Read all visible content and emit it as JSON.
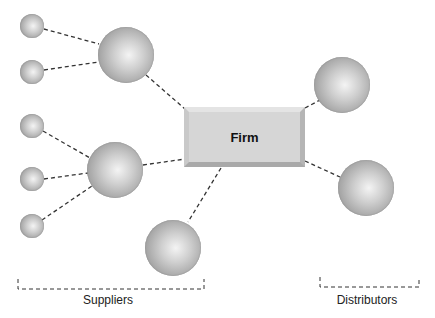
{
  "diagram": {
    "center": {
      "label": "Firm"
    },
    "groups": [
      {
        "label": "Suppliers",
        "label_x": 108,
        "label_y": 293
      },
      {
        "label": "Distributors",
        "label_x": 367,
        "label_y": 293
      }
    ],
    "nodes": {
      "small_suppliers": [
        {
          "cx": 32,
          "cy": 26,
          "r": 12
        },
        {
          "cx": 32,
          "cy": 72,
          "r": 12
        },
        {
          "cx": 32,
          "cy": 126,
          "r": 12
        },
        {
          "cx": 32,
          "cy": 179,
          "r": 12
        },
        {
          "cx": 32,
          "cy": 226,
          "r": 12
        }
      ],
      "large_suppliers": [
        {
          "cx": 126,
          "cy": 55,
          "r": 28
        },
        {
          "cx": 115,
          "cy": 170,
          "r": 28
        },
        {
          "cx": 173,
          "cy": 248,
          "r": 28
        }
      ],
      "distributors": [
        {
          "cx": 342,
          "cy": 85,
          "r": 28
        },
        {
          "cx": 366,
          "cy": 188,
          "r": 28
        }
      ]
    },
    "edges": [
      {
        "x1": 44,
        "y1": 29,
        "x2": 99,
        "y2": 44
      },
      {
        "x1": 44,
        "y1": 70,
        "x2": 99,
        "y2": 62
      },
      {
        "x1": 146,
        "y1": 75,
        "x2": 185,
        "y2": 109
      },
      {
        "x1": 43,
        "y1": 131,
        "x2": 90,
        "y2": 158
      },
      {
        "x1": 44,
        "y1": 179,
        "x2": 88,
        "y2": 173
      },
      {
        "x1": 42,
        "y1": 220,
        "x2": 92,
        "y2": 186
      },
      {
        "x1": 143,
        "y1": 165,
        "x2": 185,
        "y2": 159
      },
      {
        "x1": 221,
        "y1": 168,
        "x2": 188,
        "y2": 222
      },
      {
        "x1": 305,
        "y1": 108,
        "x2": 320,
        "y2": 100
      },
      {
        "x1": 305,
        "y1": 161,
        "x2": 340,
        "y2": 177
      }
    ],
    "brackets": [
      {
        "x1": 18,
        "x2": 204,
        "ytop": 279,
        "ybottom": 289
      },
      {
        "x1": 320,
        "x2": 419,
        "ytop": 277,
        "ybottom": 287
      }
    ],
    "colors": {
      "line": "#333333",
      "node_dark": "#8a8a8a",
      "node_light": "#f4f4f4",
      "box_face": "#d6d6d6"
    }
  }
}
